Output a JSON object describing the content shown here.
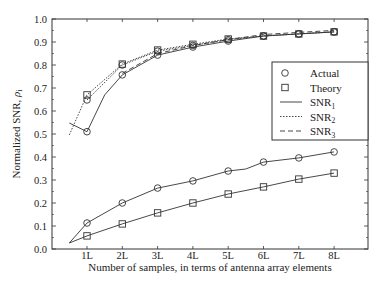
{
  "chart_data": {
    "type": "line",
    "title": "",
    "xlabel": "Number of samples, in terms of antenna array elements",
    "ylabel": "Normalized SNR, ρi",
    "ylabel_main": "Normalized SNR, ",
    "ylabel_symbol": "ρ",
    "ylabel_subscript": "i",
    "ylim": [
      0.0,
      1.0
    ],
    "yticks": [
      "0.0",
      "0.1",
      "0.2",
      "0.3",
      "0.4",
      "0.5",
      "0.6",
      "0.7",
      "0.8",
      "0.9",
      "1.0"
    ],
    "categories": [
      "1L",
      "2L",
      "3L",
      "4L",
      "5L",
      "6L",
      "7L",
      "8L"
    ],
    "grid": false,
    "legend_position": "upper right (inside)",
    "legend": [
      {
        "marker": "circle",
        "label": "Actual"
      },
      {
        "marker": "square",
        "label": "Theory"
      },
      {
        "line": "solid",
        "label": "SNR",
        "subscript": "1"
      },
      {
        "line": "dotted",
        "label": "SNR",
        "subscript": "2"
      },
      {
        "line": "dashed",
        "label": "SNR",
        "subscript": "3"
      }
    ],
    "series": [
      {
        "name": "SNR1 Actual",
        "style": "solid",
        "marker": "circle",
        "x": [
          0.5,
          1,
          1.5,
          2,
          3,
          4,
          5,
          6,
          7,
          8
        ],
        "values": [
          0.548,
          0.51,
          0.67,
          0.757,
          0.843,
          0.878,
          0.904,
          0.926,
          0.935,
          0.944
        ]
      },
      {
        "name": "SNR2 Theory",
        "style": "dotted",
        "marker": "square",
        "x": [
          0.5,
          1,
          2,
          3,
          4,
          5,
          6,
          7,
          8
        ],
        "values": [
          0.496,
          0.67,
          0.804,
          0.865,
          0.89,
          0.913,
          0.926,
          0.935,
          0.944
        ]
      },
      {
        "name": "SNR2 Actual",
        "style": "dotted",
        "marker": "circle",
        "x": [
          1,
          2,
          3,
          4,
          5,
          6,
          7,
          8
        ],
        "values": [
          0.648,
          0.8,
          0.86,
          0.885,
          0.91,
          0.926,
          0.935,
          0.944
        ]
      },
      {
        "name": "SNR3 Actual",
        "style": "solid",
        "marker": "circle",
        "x": [
          0.5,
          1,
          2,
          3,
          4,
          5,
          5.5,
          6,
          7,
          8
        ],
        "values": [
          0.026,
          0.113,
          0.2,
          0.265,
          0.296,
          0.339,
          0.348,
          0.378,
          0.396,
          0.422
        ]
      },
      {
        "name": "SNR3 Theory",
        "style": "solid",
        "marker": "square",
        "x": [
          0.5,
          1,
          2,
          3,
          4,
          5,
          6,
          7,
          8
        ],
        "values": [
          0.026,
          0.057,
          0.109,
          0.157,
          0.2,
          0.239,
          0.27,
          0.304,
          0.33
        ]
      }
    ]
  }
}
